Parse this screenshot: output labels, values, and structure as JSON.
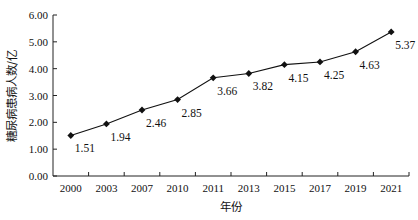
{
  "chart_data": {
    "type": "line",
    "title": "",
    "xlabel": "年份",
    "ylabel": "糖尿病患病人数/亿",
    "categories": [
      "2000",
      "2003",
      "2007",
      "2010",
      "2011",
      "2013",
      "2015",
      "2017",
      "2019",
      "2021"
    ],
    "series": [
      {
        "name": "糖尿病患病人数",
        "values": [
          1.51,
          1.94,
          2.46,
          2.85,
          3.66,
          3.82,
          4.15,
          4.25,
          4.63,
          5.37
        ],
        "marker": "diamond",
        "color": "#111111"
      }
    ],
    "data_labels": [
      "1.51",
      "1.94",
      "2.46",
      "2.85",
      "3.66",
      "3.82",
      "4.15",
      "4.25",
      "4.63",
      "5.37"
    ],
    "ylim": [
      0,
      6
    ],
    "yticks": [
      "0.00",
      "1.00",
      "2.00",
      "3.00",
      "4.00",
      "5.00",
      "6.00"
    ],
    "grid": false,
    "legend": null
  }
}
